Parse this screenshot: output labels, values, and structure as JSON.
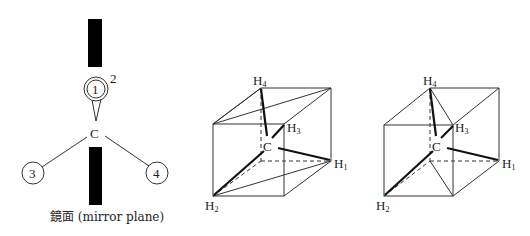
{
  "mirror_diagram": {
    "center_label": "C",
    "substituents": [
      {
        "id": "1",
        "label": "1"
      },
      {
        "id": "2",
        "label": "2"
      },
      {
        "id": "3",
        "label": "3"
      },
      {
        "id": "4",
        "label": "4"
      }
    ],
    "caption": "鏡面 (mirror plane)"
  },
  "cube_left": {
    "center_label": "C",
    "atoms": [
      {
        "main": "H",
        "sub": "4"
      },
      {
        "main": "H",
        "sub": "3"
      },
      {
        "main": "H",
        "sub": "1"
      },
      {
        "main": "H",
        "sub": "2"
      }
    ]
  },
  "cube_right": {
    "center_label": "C",
    "atoms": [
      {
        "main": "H",
        "sub": "4"
      },
      {
        "main": "H",
        "sub": "3"
      },
      {
        "main": "H",
        "sub": "1"
      },
      {
        "main": "H",
        "sub": "2"
      }
    ]
  },
  "colors": {
    "ink": "#222222",
    "mirror": "#000000",
    "background": "#ffffff"
  }
}
